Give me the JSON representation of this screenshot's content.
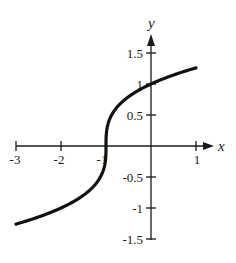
{
  "chart_data": {
    "type": "line",
    "title": "",
    "function": "y = cbrt(x + 1)",
    "xlabel": "x",
    "ylabel": "y",
    "xlim": [
      -3,
      1
    ],
    "ylim": [
      -1.5,
      1.5
    ],
    "grid": false,
    "legend": null,
    "x_ticks": [
      -3,
      -2,
      -1,
      1
    ],
    "x_tick_labels": [
      "-3",
      "-2",
      "-1",
      "1"
    ],
    "y_ticks": [
      1.5,
      1,
      0.5,
      -0.5,
      -1,
      -1.5
    ],
    "y_tick_labels": [
      "1.5",
      "1",
      "0.5",
      "-0.5",
      "-1",
      "-1.5"
    ],
    "series": [
      {
        "name": "y = cbrt(x+1)",
        "x": [
          -3,
          -2.5,
          -2,
          -1.5,
          -1.25,
          -1.1,
          -1.02,
          -1,
          -0.98,
          -0.9,
          -0.75,
          -0.5,
          0,
          0.5,
          1
        ],
        "y": [
          -1.26,
          -1.145,
          -1.0,
          -0.794,
          -0.63,
          -0.464,
          -0.271,
          0,
          0.271,
          0.464,
          0.63,
          0.794,
          1.0,
          1.145,
          1.26
        ]
      }
    ]
  },
  "labels": {
    "x_axis": "x",
    "y_axis": "y",
    "xtick_m3": "-3",
    "xtick_m2": "-2",
    "xtick_m1": "-1",
    "xtick_1": "1",
    "ytick_1_5": "1.5",
    "ytick_1": "1",
    "ytick_0_5": "0.5",
    "ytick_m0_5": "-0.5",
    "ytick_m1": "-1",
    "ytick_m1_5": "-1.5"
  }
}
